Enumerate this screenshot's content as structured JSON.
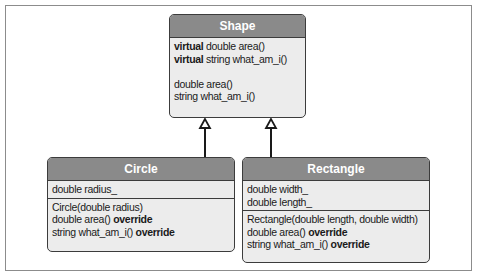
{
  "diagram": {
    "type": "uml-class-inheritance",
    "colors": {
      "header_bg": "#8a8a8a",
      "body_bg": "#ececec",
      "border": "#3c3c3c",
      "header_text": "#ffffff"
    },
    "shape": {
      "name": "Shape",
      "virtual_methods": [
        {
          "prefix": "virtual",
          "text": " double area()"
        },
        {
          "prefix": "virtual",
          "text": " string what_am_i()"
        }
      ],
      "methods": [
        "double area()",
        "string what_am_i()"
      ]
    },
    "circle": {
      "name": "Circle",
      "attributes": [
        "double radius_"
      ],
      "methods": [
        {
          "text": "Circle(double radius)",
          "suffix": ""
        },
        {
          "text": "double area() ",
          "suffix": "override"
        },
        {
          "text": "string what_am_i() ",
          "suffix": "override"
        }
      ]
    },
    "rectangle": {
      "name": "Rectangle",
      "attributes": [
        "double width_",
        "double length_"
      ],
      "methods": [
        {
          "text": "Rectangle(double length, double width)",
          "suffix": ""
        },
        {
          "text": "double area() ",
          "suffix": "override"
        },
        {
          "text": "string what_am_i() ",
          "suffix": "override"
        }
      ]
    },
    "relationships": [
      {
        "from": "Circle",
        "to": "Shape",
        "kind": "inheritance"
      },
      {
        "from": "Rectangle",
        "to": "Shape",
        "kind": "inheritance"
      }
    ]
  }
}
